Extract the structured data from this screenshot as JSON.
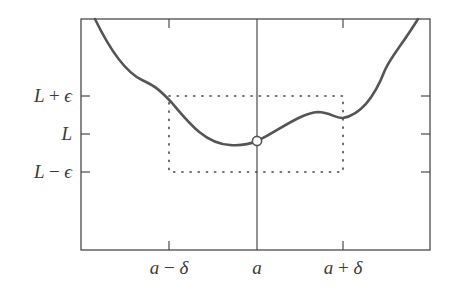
{
  "diagram": {
    "type": "epsilon-delta limit illustration",
    "colors": {
      "axis": "#4a4a4a",
      "curve": "#555555",
      "dotted_box": "#444444",
      "background": "#ffffff",
      "text": "#3a3a3a"
    },
    "y_labels": {
      "upper": {
        "base": "L",
        "op": "+",
        "sym": "ϵ"
      },
      "middle": {
        "base": "L"
      },
      "lower": {
        "base": "L",
        "op": "−",
        "sym": "ϵ"
      }
    },
    "x_labels": {
      "left": {
        "base": "a",
        "op": "−",
        "sym": "δ"
      },
      "middle": {
        "base": "a"
      },
      "right": {
        "base": "a",
        "op": "+",
        "sym": "δ"
      }
    },
    "point_marker": "open-circle at (a, L)",
    "box": "dotted rectangle spanning x in [a−δ, a+δ] and y in [L−ϵ, L+ϵ]"
  }
}
